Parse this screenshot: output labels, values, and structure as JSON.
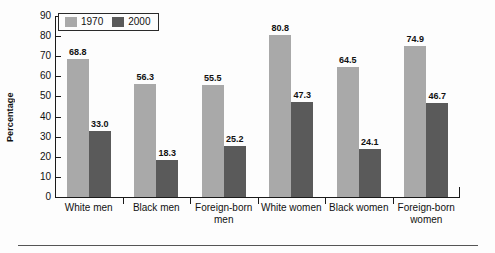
{
  "chart_data": {
    "type": "bar",
    "title": "",
    "xlabel": "",
    "ylabel": "Percentage",
    "ylim": [
      0,
      90
    ],
    "ytick_step": 10,
    "yticks": [
      0,
      10,
      20,
      30,
      40,
      50,
      60,
      70,
      80,
      90
    ],
    "grid": false,
    "legend_position": "top-left",
    "categories": [
      "White men",
      "Black men",
      "Foreign-born\nmen",
      "White women",
      "Black women",
      "Foreign-born\nwomen"
    ],
    "series": [
      {
        "name": "1970",
        "color": "#a9a9a9",
        "values": [
          68.8,
          56.3,
          55.5,
          80.8,
          64.5,
          74.9
        ],
        "labels": [
          "68.8",
          "56.3",
          "55.5",
          "80.8",
          "64.5",
          "74.9"
        ]
      },
      {
        "name": "2000",
        "color": "#5a5a5a",
        "values": [
          33.0,
          18.3,
          25.2,
          47.3,
          24.1,
          46.7
        ],
        "labels": [
          "33.0",
          "18.3",
          "25.2",
          "47.3",
          "24.1",
          "46.7"
        ]
      }
    ]
  },
  "axis": {
    "tick_labels": [
      "90",
      "80",
      "70",
      "60",
      "50",
      "40",
      "30",
      "20",
      "10",
      "0"
    ],
    "y_title": "Percentage"
  },
  "legend": {
    "items": [
      {
        "label": "1970",
        "swatch": "legend-swatch-1970"
      },
      {
        "label": "2000",
        "swatch": "legend-swatch-2000"
      }
    ]
  }
}
